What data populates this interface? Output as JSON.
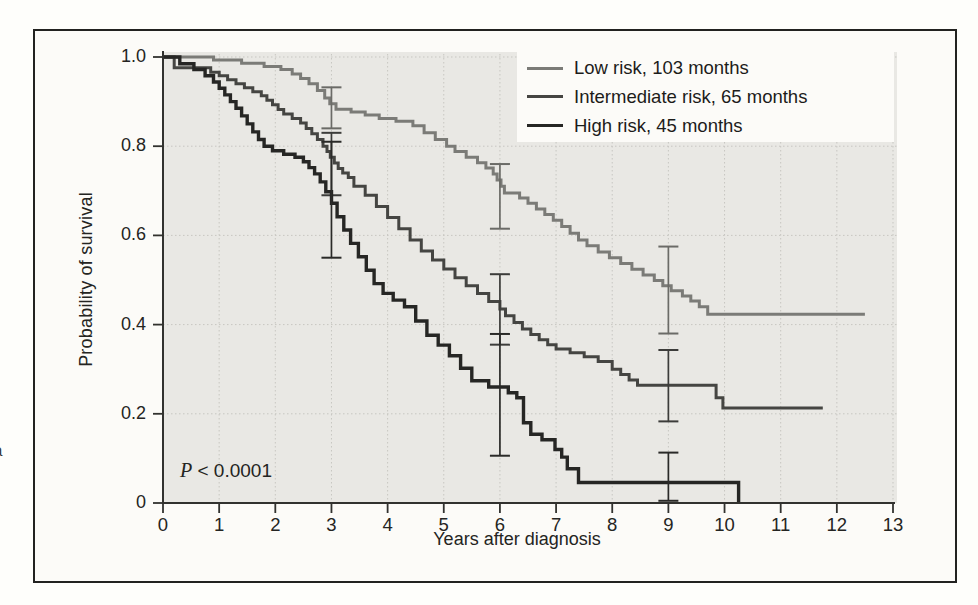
{
  "chart_data": {
    "type": "line",
    "chart_kind": "kaplan-meier-survival-steps",
    "title": "",
    "xlabel": "Years after diagnosis",
    "ylabel": "Probability of survival",
    "xlim": [
      0,
      13
    ],
    "ylim": [
      0,
      1.0
    ],
    "x_ticks": [
      0,
      1,
      2,
      3,
      4,
      5,
      6,
      7,
      8,
      9,
      10,
      11,
      12,
      13
    ],
    "x_tick_labels": [
      "0",
      "1",
      "2",
      "3",
      "4",
      "5",
      "6",
      "7",
      "8",
      "9",
      "10",
      "11",
      "12",
      "13"
    ],
    "y_tick_values": [
      1.0,
      0.8,
      0.6,
      0.4,
      0.2,
      0
    ],
    "y_tick_labels": [
      "1.0",
      "0.8",
      "0.6",
      "0.4",
      "0.2",
      "0"
    ],
    "grid": true,
    "grid_style": "dotted",
    "legend_position": "top-right",
    "annotation": {
      "p_symbol": "P",
      "p_rest": " < 0.0001",
      "full": "P < 0.0001"
    },
    "series": [
      {
        "id": "low-risk",
        "label": "Low risk, 103 months",
        "median_survival_months": 103,
        "color": "#7b7b77",
        "bar_color": "#6b6b67",
        "width": 3,
        "steps": [
          [
            0,
            1.0
          ],
          [
            0.9,
            0.993
          ],
          [
            1.4,
            0.986
          ],
          [
            1.8,
            0.979
          ],
          [
            2.1,
            0.972
          ],
          [
            2.3,
            0.962
          ],
          [
            2.45,
            0.952
          ],
          [
            2.6,
            0.94
          ],
          [
            2.75,
            0.925
          ],
          [
            2.88,
            0.908
          ],
          [
            2.97,
            0.895
          ],
          [
            3.08,
            0.883
          ],
          [
            3.35,
            0.877
          ],
          [
            3.6,
            0.87
          ],
          [
            3.85,
            0.862
          ],
          [
            4.15,
            0.856
          ],
          [
            4.45,
            0.846
          ],
          [
            4.65,
            0.83
          ],
          [
            4.85,
            0.815
          ],
          [
            5.05,
            0.8
          ],
          [
            5.2,
            0.788
          ],
          [
            5.4,
            0.775
          ],
          [
            5.6,
            0.763
          ],
          [
            5.75,
            0.751
          ],
          [
            5.88,
            0.738
          ],
          [
            5.95,
            0.724
          ],
          [
            6.02,
            0.71
          ],
          [
            6.08,
            0.695
          ],
          [
            6.35,
            0.684
          ],
          [
            6.5,
            0.672
          ],
          [
            6.65,
            0.659
          ],
          [
            6.8,
            0.647
          ],
          [
            6.95,
            0.634
          ],
          [
            7.1,
            0.62
          ],
          [
            7.25,
            0.605
          ],
          [
            7.4,
            0.59
          ],
          [
            7.55,
            0.577
          ],
          [
            7.75,
            0.563
          ],
          [
            7.95,
            0.55
          ],
          [
            8.15,
            0.537
          ],
          [
            8.35,
            0.524
          ],
          [
            8.55,
            0.511
          ],
          [
            8.75,
            0.499
          ],
          [
            8.9,
            0.487
          ],
          [
            9.05,
            0.476
          ],
          [
            9.25,
            0.464
          ],
          [
            9.4,
            0.453
          ],
          [
            9.55,
            0.44
          ],
          [
            9.7,
            0.423
          ],
          [
            12.5,
            0.423
          ]
        ],
        "error_bars": [
          {
            "x": 3,
            "lo": 0.84,
            "hi": 0.932
          },
          {
            "x": 6,
            "lo": 0.615,
            "hi": 0.76
          },
          {
            "x": 9,
            "lo": 0.38,
            "hi": 0.575
          }
        ]
      },
      {
        "id": "intermediate-risk",
        "label": "Intermediate risk, 65 months",
        "median_survival_months": 65,
        "color": "#454542",
        "bar_color": "#3c3c3a",
        "width": 3,
        "steps": [
          [
            0,
            1.0
          ],
          [
            0.2,
            0.976
          ],
          [
            0.85,
            0.966
          ],
          [
            1.0,
            0.958
          ],
          [
            1.15,
            0.949
          ],
          [
            1.3,
            0.94
          ],
          [
            1.45,
            0.931
          ],
          [
            1.6,
            0.922
          ],
          [
            1.75,
            0.913
          ],
          [
            1.85,
            0.903
          ],
          [
            1.95,
            0.893
          ],
          [
            2.05,
            0.882
          ],
          [
            2.15,
            0.872
          ],
          [
            2.3,
            0.862
          ],
          [
            2.45,
            0.852
          ],
          [
            2.55,
            0.84
          ],
          [
            2.65,
            0.828
          ],
          [
            2.75,
            0.815
          ],
          [
            2.85,
            0.8
          ],
          [
            2.92,
            0.788
          ],
          [
            2.98,
            0.775
          ],
          [
            3.05,
            0.762
          ],
          [
            3.12,
            0.75
          ],
          [
            3.2,
            0.74
          ],
          [
            3.3,
            0.73
          ],
          [
            3.4,
            0.71
          ],
          [
            3.6,
            0.69
          ],
          [
            3.8,
            0.665
          ],
          [
            4.0,
            0.64
          ],
          [
            4.2,
            0.615
          ],
          [
            4.4,
            0.59
          ],
          [
            4.6,
            0.565
          ],
          [
            4.8,
            0.545
          ],
          [
            5.0,
            0.525
          ],
          [
            5.2,
            0.505
          ],
          [
            5.4,
            0.487
          ],
          [
            5.6,
            0.47
          ],
          [
            5.8,
            0.452
          ],
          [
            6.0,
            0.435
          ],
          [
            6.1,
            0.42
          ],
          [
            6.25,
            0.405
          ],
          [
            6.4,
            0.39
          ],
          [
            6.55,
            0.378
          ],
          [
            6.7,
            0.366
          ],
          [
            6.85,
            0.355
          ],
          [
            7.0,
            0.345
          ],
          [
            7.25,
            0.337
          ],
          [
            7.5,
            0.328
          ],
          [
            7.75,
            0.317
          ],
          [
            8.0,
            0.3
          ],
          [
            8.15,
            0.288
          ],
          [
            8.3,
            0.276
          ],
          [
            8.45,
            0.264
          ],
          [
            9.85,
            0.236
          ],
          [
            9.97,
            0.213
          ],
          [
            11.75,
            0.213
          ]
        ],
        "error_bars": [
          {
            "x": 3,
            "lo": 0.69,
            "hi": 0.83
          },
          {
            "x": 6,
            "lo": 0.355,
            "hi": 0.513
          },
          {
            "x": 9,
            "lo": 0.183,
            "hi": 0.343
          }
        ]
      },
      {
        "id": "high-risk",
        "label": "High risk, 45 months",
        "median_survival_months": 45,
        "color": "#262624",
        "bar_color": "#2a2a28",
        "width": 3.4,
        "steps": [
          [
            0,
            1.0
          ],
          [
            0.3,
            0.985
          ],
          [
            0.55,
            0.972
          ],
          [
            0.75,
            0.958
          ],
          [
            0.9,
            0.944
          ],
          [
            1.0,
            0.93
          ],
          [
            1.1,
            0.915
          ],
          [
            1.2,
            0.9
          ],
          [
            1.3,
            0.885
          ],
          [
            1.4,
            0.868
          ],
          [
            1.5,
            0.85
          ],
          [
            1.6,
            0.832
          ],
          [
            1.7,
            0.815
          ],
          [
            1.8,
            0.8
          ],
          [
            1.95,
            0.79
          ],
          [
            2.15,
            0.782
          ],
          [
            2.35,
            0.775
          ],
          [
            2.5,
            0.765
          ],
          [
            2.6,
            0.752
          ],
          [
            2.7,
            0.738
          ],
          [
            2.8,
            0.72
          ],
          [
            2.9,
            0.698
          ],
          [
            3.0,
            0.672
          ],
          [
            3.1,
            0.642
          ],
          [
            3.22,
            0.612
          ],
          [
            3.34,
            0.582
          ],
          [
            3.48,
            0.552
          ],
          [
            3.62,
            0.522
          ],
          [
            3.76,
            0.492
          ],
          [
            3.92,
            0.47
          ],
          [
            4.1,
            0.455
          ],
          [
            4.3,
            0.44
          ],
          [
            4.5,
            0.408
          ],
          [
            4.7,
            0.376
          ],
          [
            4.9,
            0.354
          ],
          [
            5.1,
            0.33
          ],
          [
            5.3,
            0.302
          ],
          [
            5.5,
            0.274
          ],
          [
            5.8,
            0.26
          ],
          [
            6.15,
            0.247
          ],
          [
            6.3,
            0.236
          ],
          [
            6.42,
            0.18
          ],
          [
            6.55,
            0.154
          ],
          [
            6.75,
            0.142
          ],
          [
            6.98,
            0.12
          ],
          [
            7.1,
            0.103
          ],
          [
            7.2,
            0.077
          ],
          [
            7.4,
            0.046
          ],
          [
            10.25,
            0.046
          ],
          [
            10.25,
            0
          ]
        ],
        "error_bars": [
          {
            "x": 3,
            "lo": 0.55,
            "hi": 0.81
          },
          {
            "x": 6,
            "lo": 0.106,
            "hi": 0.379
          },
          {
            "x": 9,
            "lo": 0.005,
            "hi": 0.113
          }
        ]
      }
    ]
  },
  "edge_fragments": [
    {
      "text": "-",
      "top": 416
    },
    {
      "text": "a",
      "top": 441
    }
  ]
}
